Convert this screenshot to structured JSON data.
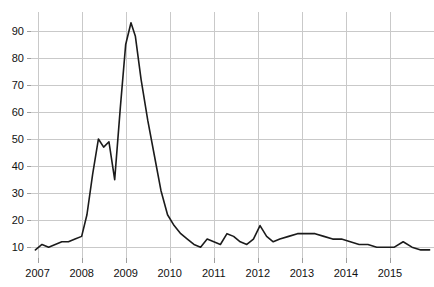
{
  "figure": {
    "title_fragment": "",
    "background": "#ffffff",
    "line_color": "#1b1b1b",
    "grid_color": "#c9c9c9",
    "text_color": "#111111"
  },
  "chart_data": {
    "type": "line",
    "title": "",
    "subtitle": "",
    "xlabel": "",
    "ylabel": "",
    "grid": true,
    "legend": "none",
    "xlim": [
      2006.85,
      2016.0
    ],
    "ylim": [
      6,
      97
    ],
    "xticks": [
      "2007",
      "2008",
      "2009",
      "2010",
      "2011",
      "2012",
      "2013",
      "2014",
      "2015"
    ],
    "xtick_values": [
      2007,
      2008,
      2009,
      2010,
      2011,
      2012,
      2013,
      2014,
      2015
    ],
    "yticks": [
      "10",
      "20",
      "30",
      "40",
      "50",
      "60",
      "70",
      "80",
      "90"
    ],
    "ytick_values": [
      10,
      20,
      30,
      40,
      50,
      60,
      70,
      80,
      90
    ],
    "series": [
      {
        "name": "value",
        "color": "#1b1b1b",
        "x": [
          2006.95,
          2007.1,
          2007.25,
          2007.4,
          2007.55,
          2007.7,
          2007.85,
          2008.0,
          2008.12,
          2008.25,
          2008.38,
          2008.5,
          2008.62,
          2008.75,
          2008.88,
          2009.0,
          2009.12,
          2009.22,
          2009.35,
          2009.5,
          2009.65,
          2009.8,
          2009.95,
          2010.1,
          2010.25,
          2010.4,
          2010.55,
          2010.7,
          2010.85,
          2011.0,
          2011.15,
          2011.3,
          2011.45,
          2011.6,
          2011.75,
          2011.9,
          2012.05,
          2012.2,
          2012.35,
          2012.5,
          2012.7,
          2012.9,
          2013.1,
          2013.3,
          2013.5,
          2013.7,
          2013.9,
          2014.1,
          2014.3,
          2014.5,
          2014.7,
          2014.9,
          2015.1,
          2015.3,
          2015.5,
          2015.7,
          2015.9
        ],
        "y": [
          9,
          11,
          10,
          11,
          12,
          12,
          13,
          14,
          22,
          37,
          50,
          47,
          49,
          35,
          62,
          85,
          93,
          88,
          72,
          57,
          44,
          31,
          22,
          18,
          15,
          13,
          11,
          10,
          13,
          12,
          11,
          15,
          14,
          12,
          11,
          13,
          18,
          14,
          12,
          13,
          14,
          15,
          15,
          15,
          14,
          13,
          13,
          12,
          11,
          11,
          10,
          10,
          10,
          12,
          10,
          9,
          9
        ]
      }
    ]
  }
}
